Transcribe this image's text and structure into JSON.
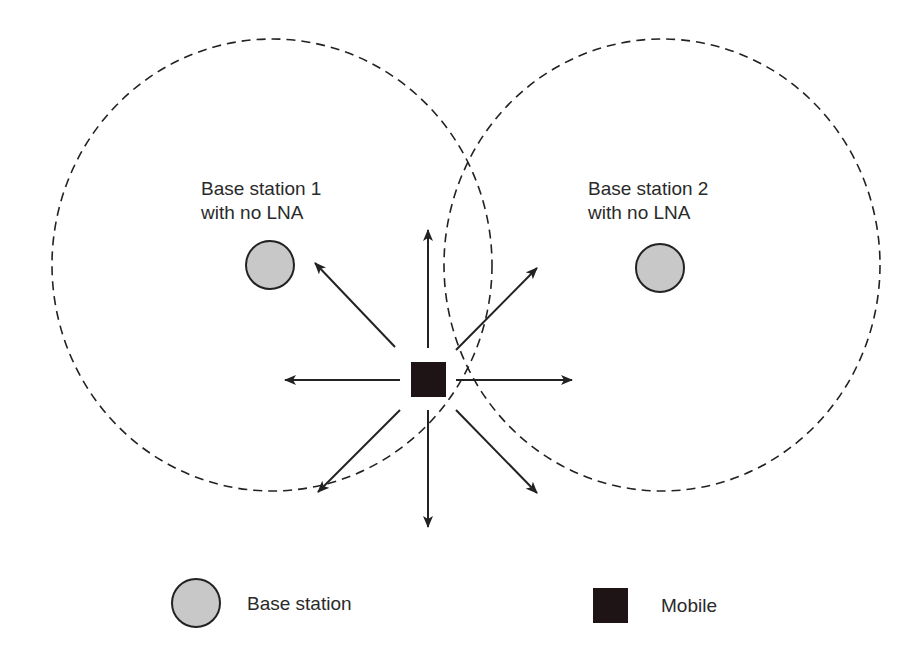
{
  "diagram": {
    "base_station_1": {
      "label_line1": "Base station 1",
      "label_line2": "with no LNA",
      "cx": 270,
      "cy": 265,
      "r": 24
    },
    "base_station_2": {
      "label_line1": "Base station 2",
      "label_line2": "with no LNA",
      "cx": 660,
      "cy": 268,
      "r": 24
    },
    "coverage_1": {
      "cx": 272,
      "cy": 265,
      "rx": 220,
      "ry": 226
    },
    "coverage_2": {
      "cx": 662,
      "cy": 265,
      "rx": 218,
      "ry": 226
    },
    "mobile": {
      "x": 411,
      "y": 362,
      "size": 35
    },
    "arrows": [
      "up",
      "down",
      "left",
      "right",
      "up-left",
      "up-right",
      "down-left",
      "down-right"
    ]
  },
  "legend": {
    "base_station_label": "Base station",
    "mobile_label": "Mobile"
  },
  "colors": {
    "station_fill": "#c8c8c8",
    "station_stroke": "#222222",
    "mobile_fill": "#1e1416",
    "line": "#222222"
  }
}
